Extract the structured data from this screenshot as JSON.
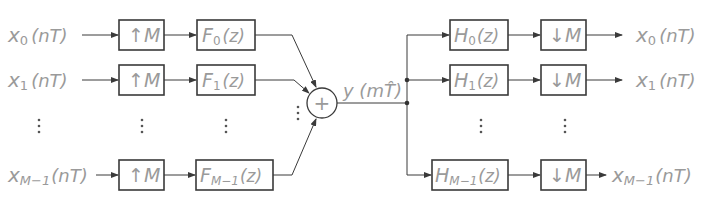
{
  "diagram": {
    "type": "transmultiplexer-filter-bank",
    "inputs": [
      {
        "symbol": "x",
        "sub": "0",
        "arg": "(nT)"
      },
      {
        "symbol": "x",
        "sub": "1",
        "arg": "(nT)"
      },
      {
        "symbol": "x",
        "sub": "M−1",
        "arg": "(nT)"
      }
    ],
    "upsamplers": [
      {
        "label": "M",
        "arrow": "↑"
      },
      {
        "label": "M",
        "arrow": "↑"
      },
      {
        "label": "M",
        "arrow": "↑"
      }
    ],
    "synthesis_filters": [
      {
        "symbol": "F",
        "sub": "0",
        "arg": "(z)"
      },
      {
        "symbol": "F",
        "sub": "1",
        "arg": "(z)"
      },
      {
        "symbol": "F",
        "sub": "M−1",
        "arg": "(z)"
      }
    ],
    "summer": {
      "symbol": "+"
    },
    "channel_signal": {
      "symbol": "y",
      "arg": "(mT̂)",
      "text": "y (mT̂)"
    },
    "analysis_filters": [
      {
        "symbol": "H",
        "sub": "0",
        "arg": "(z)"
      },
      {
        "symbol": "H",
        "sub": "1",
        "arg": "(z)"
      },
      {
        "symbol": "H",
        "sub": "M−1",
        "arg": "(z)"
      }
    ],
    "downsamplers": [
      {
        "label": "M",
        "arrow": "↓"
      },
      {
        "label": "M",
        "arrow": "↓"
      },
      {
        "label": "M",
        "arrow": "↓"
      }
    ],
    "outputs": [
      {
        "symbol": "x",
        "sub": "0",
        "arg": "(nT)"
      },
      {
        "symbol": "x",
        "sub": "1",
        "arg": "(nT)"
      },
      {
        "symbol": "x",
        "sub": "M−1",
        "arg": "(nT)"
      }
    ],
    "ellipsis": "⋮"
  }
}
